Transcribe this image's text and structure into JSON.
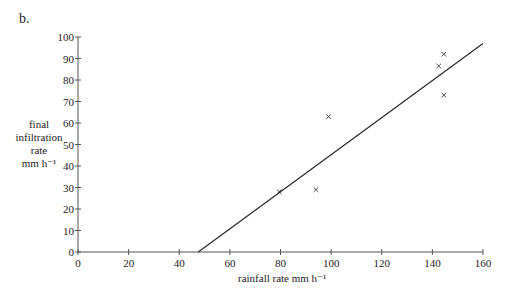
{
  "chart_data": {
    "type": "scatter",
    "panel_label": "b.",
    "title": "",
    "xlabel": "rainfall rate  mm h⁻¹",
    "ylabel_lines": [
      "final",
      "infiltration",
      "rate",
      "mm h⁻¹"
    ],
    "xlim": [
      0,
      160
    ],
    "ylim": [
      0,
      100
    ],
    "x_ticks": [
      0,
      20,
      40,
      60,
      80,
      100,
      120,
      140,
      160
    ],
    "y_ticks": [
      0,
      10,
      20,
      30,
      40,
      50,
      60,
      70,
      80,
      90,
      100
    ],
    "grid": false,
    "legend": null,
    "series": [
      {
        "name": "observations",
        "marker": "x",
        "points": [
          {
            "x": 79.5,
            "y": 28
          },
          {
            "x": 94,
            "y": 29
          },
          {
            "x": 99,
            "y": 63
          },
          {
            "x": 142.5,
            "y": 86.5
          },
          {
            "x": 144.5,
            "y": 92
          },
          {
            "x": 144.5,
            "y": 73
          }
        ]
      },
      {
        "name": "fitted line",
        "type": "line",
        "points": [
          {
            "x": 47.5,
            "y": 0
          },
          {
            "x": 160,
            "y": 97
          }
        ]
      }
    ]
  }
}
